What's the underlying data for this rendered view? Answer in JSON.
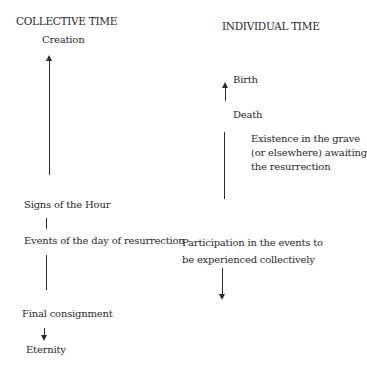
{
  "headings": {
    "collective": "COLLECTIVE TIME",
    "individual": "INDIVIDUAL TIME"
  },
  "collective": {
    "creation": "Creation",
    "signs": "Signs of the Hour",
    "events": "Events of the day of resurrection",
    "final": "Final consignment",
    "eternity": "Eternity"
  },
  "individual": {
    "birth": "Birth",
    "death": "Death",
    "grave": [
      "Existence in the grave",
      "(or elsewhere) awaiting",
      "the resurrection"
    ],
    "participation": [
      "Participation in the events to",
      "be experienced collectively"
    ]
  }
}
